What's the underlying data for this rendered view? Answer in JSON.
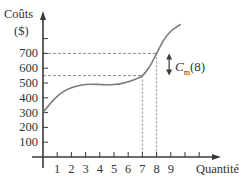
{
  "chart_data": {
    "type": "line",
    "title": "",
    "xlabel": "Quantité",
    "ylabel": "Coûts ($)",
    "ylabel_line1": "Coûts",
    "ylabel_line2": "($)",
    "x_ticks": [
      1,
      2,
      3,
      4,
      5,
      6,
      7,
      8,
      9,
      10,
      11
    ],
    "x_tick_labels": [
      "1",
      "2",
      "3",
      "4",
      "5",
      "6",
      "7",
      "8",
      "9"
    ],
    "y_ticks": [
      100,
      200,
      300,
      400,
      500,
      600,
      700,
      800
    ],
    "y_tick_labels": [
      "100",
      "200",
      "300",
      "400",
      "500",
      "600",
      "700"
    ],
    "xlim": [
      0,
      12.5
    ],
    "ylim": [
      0,
      980
    ],
    "grid": false,
    "series": [
      {
        "name": "Coût total",
        "x": [
          0,
          0.5,
          1,
          1.5,
          2,
          2.5,
          3,
          3.5,
          4,
          4.5,
          5,
          5.5,
          6,
          6.5,
          7,
          7.5,
          8,
          8.5,
          9,
          9.5,
          9.7
        ],
        "values": [
          300,
          360,
          410,
          445,
          468,
          482,
          490,
          492,
          490,
          488,
          490,
          496,
          508,
          525,
          550,
          610,
          700,
          790,
          850,
          885,
          895
        ]
      }
    ],
    "annotations": [
      {
        "type": "dashed-guide",
        "x": 7,
        "y": 550
      },
      {
        "type": "dashed-guide",
        "x": 8,
        "y": 700
      },
      {
        "type": "double-arrow",
        "x": 8.6,
        "from": 550,
        "to": 700,
        "label": "C_m(8)"
      }
    ],
    "annotation_label": {
      "main": "C",
      "sub": "m",
      "arg": "(8)"
    },
    "colors": {
      "curve": "#7a7a7a",
      "axis": "#3a3a3a",
      "dash": "#8a8a8a",
      "text": "#333333"
    }
  }
}
